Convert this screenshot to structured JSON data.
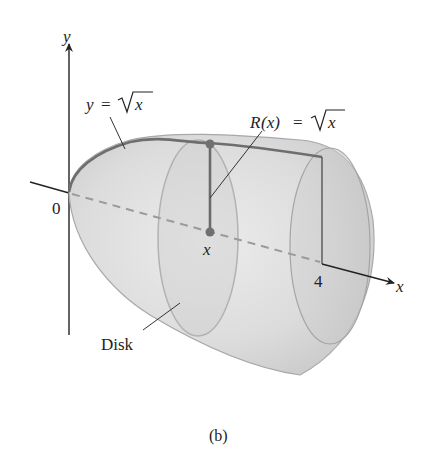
{
  "figure": {
    "caption": "(b)",
    "axes": {
      "y_label": "y",
      "x_label": "x",
      "origin_label": "0",
      "x_tick_label": "4"
    },
    "labels": {
      "curve": "y = √x",
      "curve_lhs": "y",
      "curve_eq": "=",
      "curve_rhs": "x",
      "radius": "R(x) = √x",
      "radius_lhs_R": "R",
      "radius_lhs_arg": "(x)",
      "radius_eq": "=",
      "radius_rhs": "x",
      "point_x": "x",
      "disk": "Disk"
    },
    "colors": {
      "solid_fill": "#d9d9d9",
      "solid_edge": "#9a9a9a",
      "curve": "#6e6e6e",
      "axis": "#222222",
      "dashed_axis": "#9a9a9a",
      "point": "#707070"
    }
  }
}
